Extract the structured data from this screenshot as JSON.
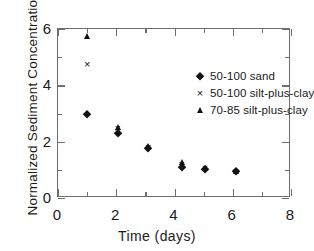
{
  "chart_data": {
    "type": "scatter",
    "title": "",
    "xlabel": "Time  (days)",
    "ylabel": "Normalized Sediment Concentrations",
    "xlim": [
      0,
      8
    ],
    "ylim": [
      0,
      6
    ],
    "xticks": [
      0,
      2,
      4,
      6,
      8
    ],
    "yticks": [
      0,
      2,
      4,
      6
    ],
    "xtick_labels": [
      "0",
      "2",
      "4",
      "6",
      "8"
    ],
    "ytick_labels": [
      "0",
      "2",
      "4",
      "6"
    ],
    "xminor_ticks": [
      1,
      3,
      5,
      7
    ],
    "yminor_ticks": [
      1,
      3,
      5
    ],
    "grid": false,
    "legend_position": "upper right",
    "series": [
      {
        "name": "50-100  sand",
        "marker": "diamond",
        "color": "#111111",
        "points": [
          {
            "x": 1.0,
            "y": 3.0
          },
          {
            "x": 2.05,
            "y": 2.3
          },
          {
            "x": 3.1,
            "y": 1.78
          },
          {
            "x": 4.25,
            "y": 1.1
          },
          {
            "x": 5.05,
            "y": 1.02
          },
          {
            "x": 6.1,
            "y": 0.95
          }
        ]
      },
      {
        "name": "50-100  silt-plus-clay",
        "marker": "cross",
        "color": "#111111",
        "points": [
          {
            "x": 1.0,
            "y": 4.75
          },
          {
            "x": 2.05,
            "y": 2.5
          },
          {
            "x": 3.1,
            "y": 1.82
          },
          {
            "x": 4.25,
            "y": 1.2
          },
          {
            "x": 5.05,
            "y": 1.05
          },
          {
            "x": 6.1,
            "y": 0.95
          }
        ]
      },
      {
        "name": "70-85  silt-plus-clay",
        "marker": "triangle",
        "color": "#111111",
        "points": [
          {
            "x": 1.0,
            "y": 5.75
          },
          {
            "x": 2.05,
            "y": 2.52
          },
          {
            "x": 3.1,
            "y": 1.85
          },
          {
            "x": 4.25,
            "y": 1.28
          },
          {
            "x": 5.05,
            "y": 1.08
          },
          {
            "x": 6.1,
            "y": 0.96
          }
        ]
      }
    ]
  },
  "legend": {
    "entries": [
      {
        "label": "50-100  sand",
        "marker": "diamond"
      },
      {
        "label": "50-100  silt-plus-clay",
        "marker": "cross"
      },
      {
        "label": "70-85  silt-plus-clay",
        "marker": "triangle"
      }
    ]
  },
  "axis": {
    "x_title": "Time  (days)",
    "y_title": "Normalized Sediment Concentrations"
  }
}
